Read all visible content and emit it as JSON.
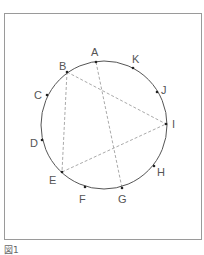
{
  "figure": {
    "caption": "図1",
    "circle": {
      "cx": 104,
      "cy": 125,
      "rx": 63,
      "ry": 64,
      "stroke": "#555555"
    },
    "points": [
      {
        "name": "A",
        "x": 96,
        "y": 62,
        "lx": 91,
        "ly": 56
      },
      {
        "name": "B",
        "x": 67,
        "y": 72,
        "lx": 59,
        "ly": 70
      },
      {
        "name": "C",
        "x": 47,
        "y": 95,
        "lx": 34,
        "ly": 99
      },
      {
        "name": "D",
        "x": 42,
        "y": 140,
        "lx": 30,
        "ly": 147
      },
      {
        "name": "E",
        "x": 62,
        "y": 172,
        "lx": 49,
        "ly": 184
      },
      {
        "name": "F",
        "x": 85,
        "y": 187,
        "lx": 79,
        "ly": 203
      },
      {
        "name": "G",
        "x": 122,
        "y": 188,
        "lx": 118,
        "ly": 203
      },
      {
        "name": "H",
        "x": 154,
        "y": 166,
        "lx": 157,
        "ly": 176
      },
      {
        "name": "I",
        "x": 166,
        "y": 124,
        "lx": 172,
        "ly": 128
      },
      {
        "name": "J",
        "x": 157,
        "y": 92,
        "lx": 161,
        "ly": 94
      },
      {
        "name": "K",
        "x": 133,
        "y": 68,
        "lx": 132,
        "ly": 63
      }
    ],
    "segments": [
      {
        "from": "B",
        "to": "I"
      },
      {
        "from": "B",
        "to": "E"
      },
      {
        "from": "A",
        "to": "G"
      },
      {
        "from": "E",
        "to": "I"
      }
    ],
    "segment_color": "#aaaaaa"
  }
}
